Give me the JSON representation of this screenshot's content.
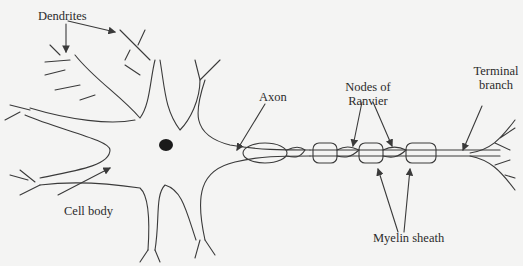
{
  "diagram": {
    "background": "#f4f4f3",
    "line_color": "#3a3a3a",
    "labels": {
      "dendrites": "Dendrites",
      "axon": "Axon",
      "nodes_line1": "Nodes of",
      "nodes_line2": "Ranvier",
      "terminal_line1": "Terminal",
      "terminal_line2": "branch",
      "cell_body": "Cell body",
      "myelin": "Myelin sheath"
    }
  }
}
